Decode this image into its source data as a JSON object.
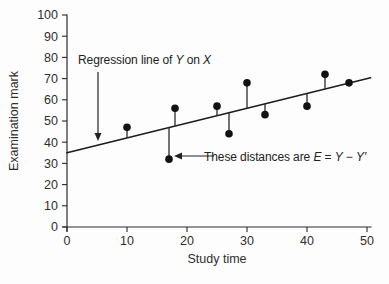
{
  "figure": {
    "background": "#fdfdfd",
    "ink_color": "#222222"
  },
  "chart_data": {
    "type": "scatter",
    "title": "",
    "xlabel": "Study time",
    "ylabel": "Examination mark",
    "xlim": [
      0,
      50
    ],
    "ylim": [
      0,
      100
    ],
    "x_ticks": [
      0,
      10,
      20,
      30,
      40,
      50
    ],
    "y_ticks": [
      0,
      10,
      20,
      30,
      40,
      50,
      60,
      70,
      80,
      90,
      100
    ],
    "grid": false,
    "legend": "none",
    "points": [
      [
        10,
        47
      ],
      [
        17,
        32
      ],
      [
        18,
        56
      ],
      [
        25,
        57
      ],
      [
        27,
        44
      ],
      [
        30,
        68
      ],
      [
        33,
        53
      ],
      [
        40,
        57
      ],
      [
        43,
        72
      ],
      [
        47,
        68
      ]
    ],
    "regression_line": {
      "x_start": 0,
      "y_start": 35,
      "x_end": 50,
      "y_end": 70
    },
    "residual_stems_shown": true,
    "annotations": [
      {
        "name": "regression-line-label",
        "text": "Regression line of Y on X",
        "segments": [
          {
            "t": "Regression line of ",
            "i": false
          },
          {
            "t": "Y",
            "i": true
          },
          {
            "t": " on ",
            "i": false
          },
          {
            "t": "X",
            "i": true
          }
        ],
        "text_px": [
          78,
          64
        ],
        "arrow_from_px": [
          98,
          72
        ],
        "arrow_tip_px": [
          98,
          141
        ],
        "arrow_dir": "down"
      },
      {
        "name": "residual-distance-label",
        "text": "These distances are E = Y − Y′",
        "segments": [
          {
            "t": "These distances are ",
            "i": false
          },
          {
            "t": "E",
            "i": true
          },
          {
            "t": " = ",
            "i": false
          },
          {
            "t": "Y",
            "i": true
          },
          {
            "t": " − ",
            "i": false
          },
          {
            "t": "Y′",
            "i": true
          }
        ],
        "text_px": [
          204,
          161
        ],
        "arrow_from_px": [
          214,
          156
        ],
        "arrow_tip_px": [
          174,
          156
        ],
        "arrow_dir": "left"
      }
    ]
  }
}
